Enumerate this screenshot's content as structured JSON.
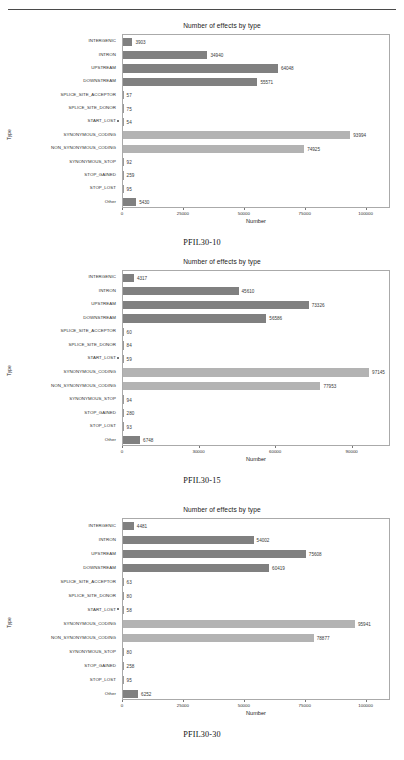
{
  "page": {
    "running_head": "",
    "y_axis_title": "Type",
    "x_axis_title": "Number",
    "chart_title": "Number of effects by type",
    "colors": {
      "bar_dark": "#808080",
      "bar_light": "#b3b3b3",
      "axis": "#aaaaaa",
      "text": "#2e2e2e"
    }
  },
  "categories": [
    "INTERGENIC",
    "INTRON",
    "UPSTREAM",
    "DOWNSTREAM",
    "SPLICE_SITE_ACCEPTOR",
    "SPLICE_SITE_DONOR",
    "START_LOST",
    "SYNONYMOUS_CODING",
    "NON_SYNONYMOUS_CODING",
    "SYNONYMOUS_STOP",
    "STOP_GAINED",
    "STOP_LOST",
    "Other"
  ],
  "chart_data": [
    {
      "type": "bar",
      "orientation": "horizontal",
      "title": "Number of effects by type",
      "caption": "PFIL30-10",
      "xlabel": "Number",
      "ylabel": "Type",
      "grid": false,
      "legend": "none",
      "xlim": [
        0,
        110000
      ],
      "xticks": [
        0,
        25000,
        50000,
        75000,
        100000
      ],
      "xticklabels": [
        "0",
        "25000",
        "50000",
        "75000",
        "100000"
      ],
      "categories": [
        "INTERGENIC",
        "INTRON",
        "UPSTREAM",
        "DOWNSTREAM",
        "SPLICE_SITE_ACCEPTOR",
        "SPLICE_SITE_DONOR",
        "START_LOST",
        "SYNONYMOUS_CODING",
        "NON_SYNONYMOUS_CODING",
        "SYNONYMOUS_STOP",
        "STOP_GAINED",
        "STOP_LOST",
        "Other"
      ],
      "values": [
        3903,
        34940,
        64048,
        55571,
        57,
        75,
        54,
        93994,
        74925,
        92,
        259,
        95,
        5430
      ],
      "labels": [
        "3903",
        "34940",
        "64048",
        "55571",
        "57",
        "75",
        "54",
        "93994",
        "74925",
        "92",
        "259",
        "95",
        "5430"
      ],
      "shades": [
        "dark",
        "dark",
        "dark",
        "dark",
        "dark",
        "dark",
        "dark",
        "light",
        "light",
        "dark",
        "dark",
        "dark",
        "dark"
      ]
    },
    {
      "type": "bar",
      "orientation": "horizontal",
      "title": "Number of effects by type",
      "caption": "PFIL30-15",
      "xlabel": "Number",
      "ylabel": "Type",
      "grid": false,
      "legend": "none",
      "xlim": [
        0,
        105000
      ],
      "xticks": [
        0,
        30000,
        60000,
        90000
      ],
      "xticklabels": [
        "0",
        "30000",
        "60000",
        "90000"
      ],
      "categories": [
        "INTERGENIC",
        "INTRON",
        "UPSTREAM",
        "DOWNSTREAM",
        "SPLICE_SITE_ACCEPTOR",
        "SPLICE_SITE_DONOR",
        "START_LOST",
        "SYNONYMOUS_CODING",
        "NON_SYNONYMOUS_CODING",
        "SYNONYMOUS_STOP",
        "STOP_GAINED",
        "STOP_LOST",
        "Other"
      ],
      "values": [
        4317,
        45610,
        73326,
        56586,
        60,
        84,
        59,
        97145,
        77953,
        94,
        280,
        93,
        6748
      ],
      "labels": [
        "4317",
        "45610",
        "73326",
        "56586",
        "60",
        "84",
        "59",
        "97145",
        "77953",
        "94",
        "280",
        "93",
        "6748"
      ],
      "shades": [
        "dark",
        "dark",
        "dark",
        "dark",
        "dark",
        "dark",
        "dark",
        "light",
        "light",
        "dark",
        "dark",
        "dark",
        "dark"
      ]
    },
    {
      "type": "bar",
      "orientation": "horizontal",
      "title": "Number of effects by type",
      "caption": "PFIL30-30",
      "xlabel": "Number",
      "ylabel": "Type",
      "grid": false,
      "legend": "none",
      "xlim": [
        0,
        110000
      ],
      "xticks": [
        0,
        25000,
        50000,
        75000,
        100000
      ],
      "xticklabels": [
        "0",
        "25000",
        "50000",
        "75000",
        "100000"
      ],
      "categories": [
        "INTERGENIC",
        "INTRON",
        "UPSTREAM",
        "DOWNSTREAM",
        "SPLICE_SITE_ACCEPTOR",
        "SPLICE_SITE_DONOR",
        "START_LOST",
        "SYNONYMOUS_CODING",
        "NON_SYNONYMOUS_CODING",
        "SYNONYMOUS_STOP",
        "STOP_GAINED",
        "STOP_LOST",
        "Other"
      ],
      "values": [
        4481,
        54002,
        75608,
        60419,
        63,
        80,
        58,
        95941,
        78877,
        80,
        258,
        95,
        6252
      ],
      "labels": [
        "4481",
        "54002",
        "75608",
        "60419",
        "63",
        "80",
        "58",
        "95941",
        "78877",
        "80",
        "258",
        "95",
        "6252"
      ],
      "shades": [
        "dark",
        "dark",
        "dark",
        "dark",
        "dark",
        "dark",
        "dark",
        "light",
        "light",
        "dark",
        "dark",
        "dark",
        "dark"
      ]
    }
  ]
}
